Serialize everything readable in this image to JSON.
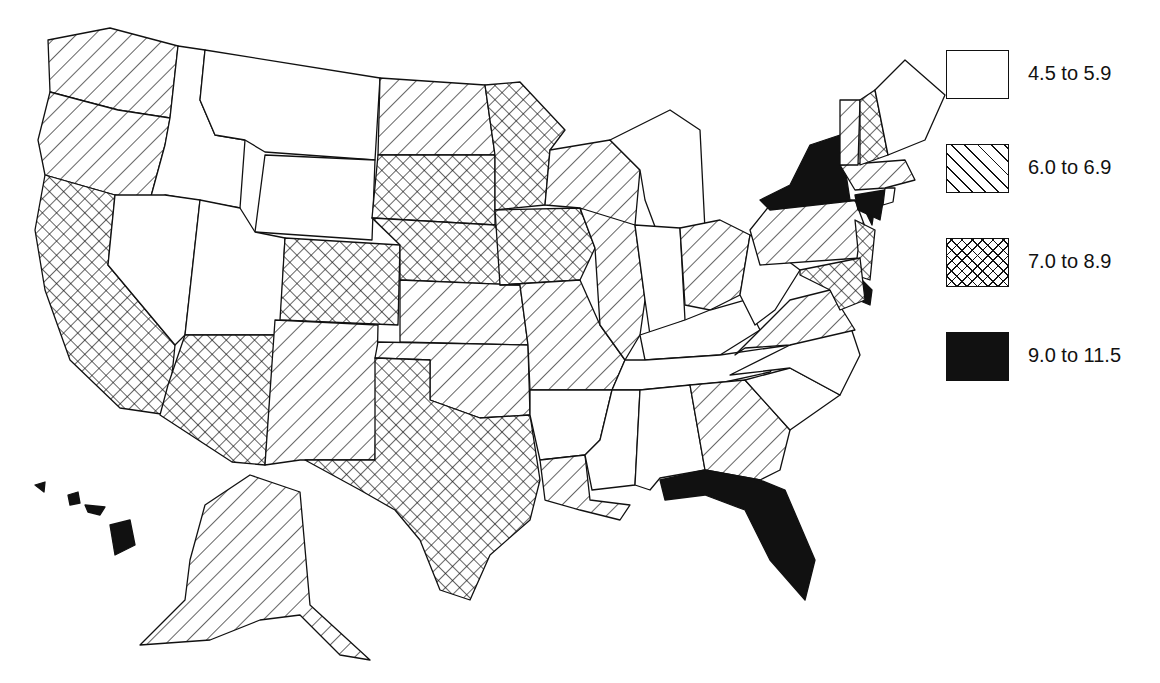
{
  "chart_data": {
    "type": "choropleth",
    "title": "",
    "region": "United States",
    "legend": {
      "position": "right",
      "classes": [
        {
          "id": "c1",
          "label": "4.5 to 5.9",
          "range": [
            4.5,
            5.9
          ],
          "pattern": "blank"
        },
        {
          "id": "c2",
          "label": "6.0 to 6.9",
          "range": [
            6.0,
            6.9
          ],
          "pattern": "diagonal-hatch"
        },
        {
          "id": "c3",
          "label": "7.0 to 8.9",
          "range": [
            7.0,
            8.9
          ],
          "pattern": "cross-hatch"
        },
        {
          "id": "c4",
          "label": "9.0 to 11.5",
          "range": [
            9.0,
            11.5
          ],
          "pattern": "solid-black"
        }
      ]
    },
    "states": {
      "WA": "c2",
      "OR": "c2",
      "CA": "c3",
      "ID": "c1",
      "NV": "c1",
      "MT": "c1",
      "WY": "c1",
      "UT": "c1",
      "CO": "c3",
      "AZ": "c3",
      "NM": "c2",
      "ND": "c2",
      "SD": "c3",
      "NE": "c3",
      "KS": "c2",
      "OK": "c2",
      "TX": "c3",
      "MN": "c3",
      "IA": "c3",
      "MO": "c2",
      "AR": "c1",
      "LA": "c2",
      "WI": "c2",
      "IL": "c2",
      "MI": "c1",
      "IN": "c1",
      "OH": "c2",
      "KY": "c1",
      "TN": "c1",
      "MS": "c1",
      "AL": "c1",
      "GA": "c2",
      "FL": "c4",
      "SC": "c1",
      "NC": "c1",
      "VA": "c2",
      "WV": "c1",
      "PA": "c2",
      "NY": "c4",
      "NJ": "c3",
      "DE": "c4",
      "MD": "c3",
      "CT": "c4",
      "RI": "c1",
      "MA": "c2",
      "VT": "c2",
      "NH": "c3",
      "ME": "c1",
      "AK": "c2",
      "HI": "c4"
    }
  },
  "legend": {
    "items": [
      {
        "label": "4.5 to 5.9"
      },
      {
        "label": "6.0 to 6.9"
      },
      {
        "label": "7.0 to 8.9"
      },
      {
        "label": "9.0 to 11.5"
      }
    ]
  }
}
